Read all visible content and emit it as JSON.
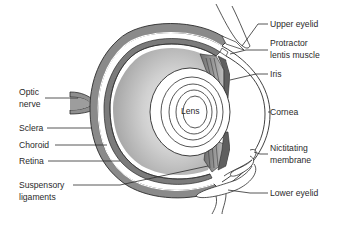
{
  "figure": {
    "colors": {
      "background": "#ffffff",
      "outline": "#2b2b2b",
      "sclera_fill": "#8c8c8c",
      "vitreous_fill": "#c9c9c9",
      "vitreous_light": "#e6e6e6",
      "lens_fill": "#ffffff",
      "label_text": "#2a2a2a"
    },
    "center_label": "Lens",
    "left_labels": [
      {
        "id": "optic-nerve",
        "line1": "Optic",
        "line2": "nerve"
      },
      {
        "id": "sclera",
        "line1": "Sclera"
      },
      {
        "id": "choroid",
        "line1": "Choroid"
      },
      {
        "id": "retina",
        "line1": "Retina"
      },
      {
        "id": "suspensory-ligaments",
        "line1": "Suspensory",
        "line2": "ligaments"
      }
    ],
    "right_labels": [
      {
        "id": "upper-eyelid",
        "line1": "Upper eyelid"
      },
      {
        "id": "protractor-lentis-muscle",
        "line1": "Protractor",
        "line2": "lentis muscle"
      },
      {
        "id": "iris",
        "line1": "Iris"
      },
      {
        "id": "cornea",
        "line1": "Cornea"
      },
      {
        "id": "nictitating-membrane",
        "line1": "Nictitating",
        "line2": "membrane"
      },
      {
        "id": "lower-eyelid",
        "line1": "Lower eyelid"
      }
    ]
  }
}
